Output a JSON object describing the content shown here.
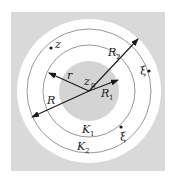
{
  "diagram": {
    "type": "concentric-annulus",
    "colors": {
      "background": "#ffffff",
      "outer_square": "#d9d9d9",
      "outer_disk": "#ffffff",
      "inner_disk": "#d4d4d4",
      "lines": "#1a1a1a",
      "circles": "#8a8a8a"
    },
    "center_label": {
      "main": "z",
      "sub": "0"
    },
    "points": [
      {
        "label": "z",
        "sub": ""
      },
      {
        "label": "ξ",
        "sub": ""
      },
      {
        "label": "ξ",
        "sub": ""
      }
    ],
    "radii": [
      {
        "label": "R",
        "sub": ""
      },
      {
        "label": "r",
        "sub": ""
      },
      {
        "label": "R",
        "sub": "1"
      },
      {
        "label": "R",
        "sub": "2"
      }
    ],
    "contours": [
      {
        "label": "K",
        "sub": "1"
      },
      {
        "label": "K",
        "sub": "2"
      }
    ]
  }
}
